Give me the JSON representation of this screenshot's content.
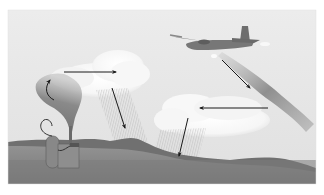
{
  "figure": {
    "subject": "cloud seeding illustration",
    "elements": {
      "ground_generator": "ground-based seeding generator emitting smoke plume",
      "aircraft": "twin-engine airplane releasing seeding trail",
      "cloud_left": "cloud over ground generator with precipitation",
      "cloud_right": "cloud below aircraft with precipitation",
      "arrows": [
        "plume rising arrow",
        "left cloud rightward wind arrow",
        "left cloud rain-down arrow",
        "aircraft trail-down arrow",
        "right cloud leftward wind arrow",
        "right cloud rain-down arrow"
      ]
    },
    "colors": {
      "sky": "#e6e6e6",
      "cloud": "#f7f7f7",
      "ridge": "#6f6f6f",
      "ground_top": "#8c8c8c",
      "ground_bottom": "#7a7a7a",
      "arrow": "#1a1a1a",
      "plume": "#7d7d7d",
      "page": "#ffffff"
    }
  }
}
